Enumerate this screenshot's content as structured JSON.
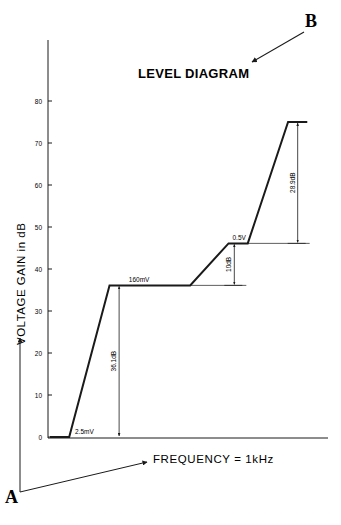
{
  "top_text": "ency response, decoder distortion, and lev...",
  "title": "LEVEL DIAGRAM",
  "callouts": {
    "a": "A",
    "b": "B"
  },
  "chart_data": {
    "type": "line",
    "title": "LEVEL DIAGRAM",
    "xlabel": "FREQUENCY = 1kHz",
    "ylabel": "VOLTAGE GAIN in dB",
    "ylim": [
      0,
      90
    ],
    "y_ticks": [
      0,
      10,
      20,
      30,
      40,
      50,
      60,
      70,
      80
    ],
    "y_tick_labels": [
      "0",
      "10",
      "20",
      "30",
      "40",
      "50",
      "60",
      "70",
      "80"
    ],
    "grid": false,
    "series": [
      {
        "name": "level",
        "points": [
          {
            "x": 0,
            "y": 0
          },
          {
            "x": 1,
            "y": 0
          },
          {
            "x": 3.1,
            "y": 36.1
          },
          {
            "x": 7.3,
            "y": 36.1
          },
          {
            "x": 9.3,
            "y": 46.1
          },
          {
            "x": 10.3,
            "y": 46.1
          },
          {
            "x": 12.4,
            "y": 75
          },
          {
            "x": 13.4,
            "y": 75
          }
        ]
      }
    ],
    "level_labels": [
      {
        "text": "2.5mV",
        "x": 1.2,
        "y": 0
      },
      {
        "text": "160mV",
        "x": 4.0,
        "y": 36.1
      },
      {
        "text": "0.5V",
        "x": 9.4,
        "y": 46.1
      }
    ],
    "gain_steps": [
      {
        "label": "36.1dB",
        "x": 3.6,
        "from": 0,
        "to": 36.1
      },
      {
        "label": "10dB",
        "x": 9.6,
        "from": 36.1,
        "to": 46.1
      },
      {
        "label": "28.9dB",
        "x": 12.9,
        "from": 46.1,
        "to": 75
      }
    ],
    "x_max": 14.5
  }
}
